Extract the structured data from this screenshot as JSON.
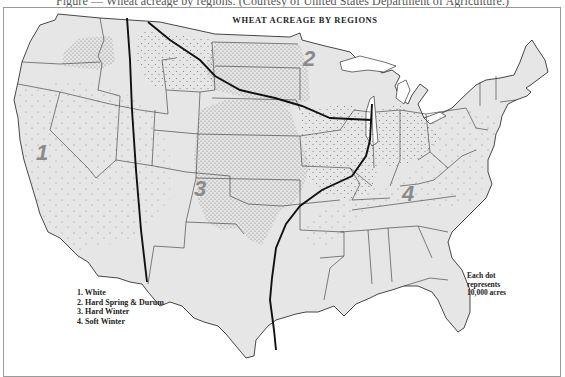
{
  "caption": "Figure — Wheat acreage by regions. (Courtesy of United States Department of Agriculture.)",
  "map": {
    "title": "WHEAT ACREAGE BY REGIONS",
    "region_labels": [
      {
        "number": "1",
        "name": "White"
      },
      {
        "number": "2",
        "name": "Hard Spring & Durum"
      },
      {
        "number": "3",
        "name": "Hard Winter"
      },
      {
        "number": "4",
        "name": "Soft Winter"
      }
    ],
    "legend": [
      "1. White",
      "2. Hard Spring & Durum",
      "3. Hard Winter",
      "4. Soft Winter"
    ],
    "dot_note": [
      "Each dot",
      "represents",
      "10,000 acres"
    ],
    "colors": {
      "land": "#e6e6e6",
      "border": "#333333",
      "region_boundary": "#111111",
      "dot": "#777777",
      "region_number": "#8a8a8a"
    }
  }
}
